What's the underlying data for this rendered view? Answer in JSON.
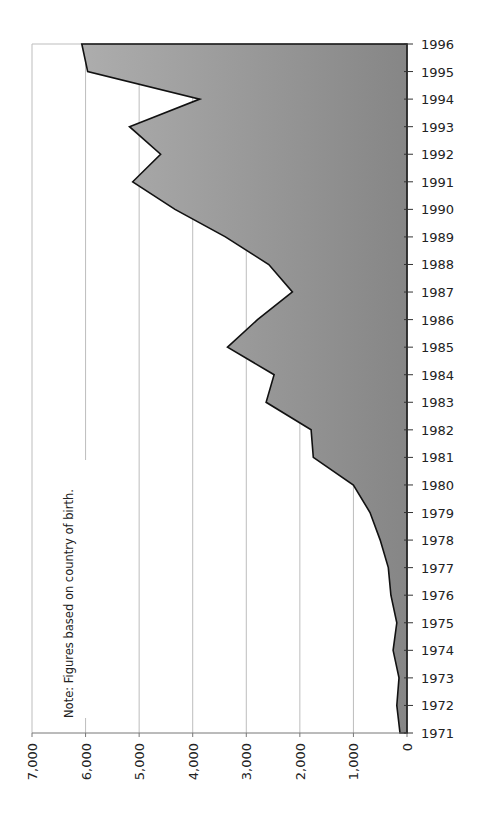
{
  "chart_data": {
    "type": "area",
    "orientation": "rotated-90",
    "title": "",
    "xlabel": "",
    "ylabel": "",
    "categories": [
      "1971",
      "1972",
      "1973",
      "1974",
      "1975",
      "1976",
      "1977",
      "1978",
      "1979",
      "1980",
      "1981",
      "1982",
      "1983",
      "1984",
      "1985",
      "1986",
      "1987",
      "1988",
      "1989",
      "1990",
      "1991",
      "1992",
      "1993",
      "1994",
      "1995",
      "1996"
    ],
    "values": [
      130,
      190,
      150,
      260,
      190,
      300,
      350,
      500,
      690,
      1000,
      1750,
      1790,
      2630,
      2480,
      3350,
      2790,
      2140,
      2580,
      3390,
      4330,
      5120,
      4600,
      5180,
      3870,
      5960,
      6070
    ],
    "value_axis": {
      "range": [
        0,
        7000
      ],
      "ticks": [
        0,
        1000,
        2000,
        3000,
        4000,
        5000,
        6000,
        7000
      ],
      "tick_labels": [
        "0",
        "1,000",
        "2,000",
        "3,000",
        "4,000",
        "5,000",
        "6,000",
        "7,000"
      ]
    },
    "grid": true,
    "legend": null,
    "annotations": [
      "Note: Figures based on country of birth."
    ],
    "colors": {
      "fill_dark": "#8a8a8a",
      "fill_light": "#a8a8a8",
      "outline": "#111111",
      "grid": "#bdbdbd",
      "axis": "#555555"
    }
  }
}
